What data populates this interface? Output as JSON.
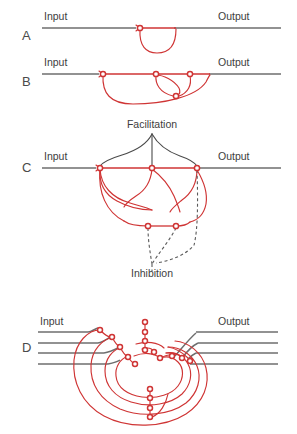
{
  "figure": {
    "background_color": "#ffffff",
    "colors": {
      "excitatory_red": "#cf3434",
      "axon_gray": "#6e6e6e",
      "text_gray": "#3d3d3d",
      "dashed_gray": "#5a5a5a"
    }
  },
  "panels": [
    {
      "id": "A",
      "label": "A",
      "description": "Single reverberating loop circuit",
      "input_label": "Input",
      "output_label": "Output",
      "synapse_count": 1,
      "loops": 1
    },
    {
      "id": "B",
      "label": "B",
      "description": "Multiple parallel reverberating loops",
      "input_label": "Input",
      "output_label": "Output",
      "synapse_count": 4,
      "loops": 3
    },
    {
      "id": "C",
      "label": "C",
      "description": "Reverberating circuit with facilitatory and inhibitory modulation",
      "input_label": "Input",
      "output_label": "Output",
      "facilitation_label": "Facilitation",
      "inhibition_label": "Inhibition",
      "synapse_count": 5,
      "loops": 4
    },
    {
      "id": "D",
      "label": "D",
      "description": "Complex multi-channel concentric reverberating network",
      "input_label": "Input",
      "output_label": "Output",
      "input_line_count": 4,
      "output_line_count": 4,
      "synapse_count": 18,
      "loops": 4
    }
  ]
}
